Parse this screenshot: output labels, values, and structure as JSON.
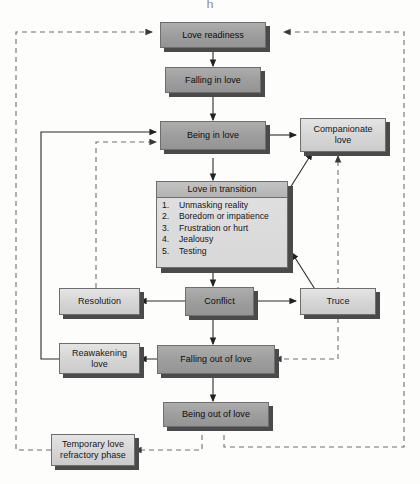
{
  "figure": {
    "title_visible_fragment": "h"
  },
  "nodes": {
    "love_readiness": {
      "label": "Love readiness",
      "tone": "dark"
    },
    "falling_in_love": {
      "label": "Falling in love",
      "tone": "dark"
    },
    "being_in_love": {
      "label": "Being in love",
      "tone": "dark"
    },
    "companionate_love": {
      "label": "Companionate love",
      "tone": "light"
    },
    "love_in_transition": {
      "header": "Love in transition",
      "items": [
        {
          "num": "1.",
          "text": "Unmasking reality"
        },
        {
          "num": "2.",
          "text": "Boredom or impatience"
        },
        {
          "num": "3.",
          "text": "Frustration or hurt"
        },
        {
          "num": "4.",
          "text": "Jealousy"
        },
        {
          "num": "5.",
          "text": "Testing"
        }
      ]
    },
    "resolution": {
      "label": "Resolution",
      "tone": "light"
    },
    "conflict": {
      "label": "Conflict",
      "tone": "dark"
    },
    "truce": {
      "label": "Truce",
      "tone": "light"
    },
    "reawakening_love": {
      "label": "Reawakening love",
      "tone": "light"
    },
    "falling_out_of_love": {
      "label": "Falling out of love",
      "tone": "dark"
    },
    "being_out_of_love": {
      "label": "Being out of love",
      "tone": "dark"
    },
    "temporary_refractory": {
      "label": "Temporary love refractory phase",
      "tone": "light"
    }
  },
  "colors": {
    "page_background": "#fdfdfb",
    "node_fill_light": "#dcdcdc",
    "node_fill_dark": "#9e9e9e",
    "node_border": "#6e6e6e",
    "node_shadow": "#4a4a4a",
    "solid_edge": "#2b2b2b",
    "dashed_edge": "#7a7a7a"
  },
  "edges": [
    {
      "name": "love-readiness-to-falling-in-love",
      "style": "solid"
    },
    {
      "name": "falling-in-love-to-being-in-love",
      "style": "solid"
    },
    {
      "name": "being-in-love-to-companionate-love",
      "style": "solid"
    },
    {
      "name": "being-in-love-to-love-in-transition",
      "style": "solid"
    },
    {
      "name": "love-in-transition-to-companionate-love",
      "style": "solid"
    },
    {
      "name": "love-in-transition-to-conflict",
      "style": "solid"
    },
    {
      "name": "conflict-to-resolution",
      "style": "solid"
    },
    {
      "name": "conflict-to-truce",
      "style": "solid"
    },
    {
      "name": "truce-to-love-in-transition",
      "style": "solid"
    },
    {
      "name": "conflict-to-falling-out-of-love",
      "style": "solid"
    },
    {
      "name": "falling-out-of-love-to-reawakening-love",
      "style": "solid"
    },
    {
      "name": "reawakening-love-to-being-in-love",
      "style": "solid"
    },
    {
      "name": "falling-out-of-love-to-being-out-of-love",
      "style": "solid"
    },
    {
      "name": "resolution-to-being-in-love",
      "style": "dashed"
    },
    {
      "name": "truce-to-companionate-love",
      "style": "dashed"
    },
    {
      "name": "truce-to-falling-out-of-love",
      "style": "dashed"
    },
    {
      "name": "being-out-of-love-to-temporary-refractory",
      "style": "dashed"
    },
    {
      "name": "being-out-of-love-to-love-readiness-right",
      "style": "dashed"
    },
    {
      "name": "temporary-refractory-to-love-readiness-left",
      "style": "dashed"
    }
  ]
}
